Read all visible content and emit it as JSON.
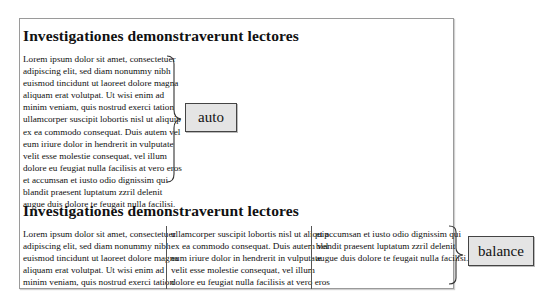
{
  "diagram": {
    "sections": [
      {
        "heading": "Investigationes demonstraverunt lectores",
        "column_fill": "auto",
        "label": "auto",
        "lines": [
          "Lorem ipsum dolor sit amet, consectetuer",
          "adipiscing elit, sed diam nonummy nibh",
          "euismod tincidunt ut laoreet dolore magna",
          "aliquam erat volutpat. Ut wisi enim ad",
          "minim veniam, quis nostrud exerci tation",
          "ullamcorper suscipit lobortis nisl ut aliquip",
          "ex ea commodo consequat. Duis autem vel",
          "eum iriure dolor in hendrerit in vulputate",
          "velit esse molestie consequat, vel illum",
          "dolore eu feugiat nulla facilisis at vero eros",
          "et accumsan et iusto odio dignissim qui",
          "blandit praesent luptatum zzril delenit",
          "augue duis dolore te feugait nulla facilisi."
        ]
      },
      {
        "heading": "Investigationes demonstraverunt lectores",
        "column_fill": "balance",
        "label": "balance",
        "columns": [
          [
            "Lorem ipsum dolor sit amet, consectetuer",
            "adipiscing elit, sed diam nonummy nibh",
            "euismod tincidunt ut laoreet dolore magna",
            "aliquam erat volutpat. Ut wisi enim ad",
            "minim veniam, quis nostrud exerci tation"
          ],
          [
            "ullamcorper suscipit lobortis nisl ut aliquip",
            "ex ea commodo consequat. Duis autem vel",
            "eum iriure dolor in hendrerit in vulputate",
            "velit esse molestie consequat, vel illum",
            "dolore eu feugiat nulla facilisis at vero eros"
          ],
          [
            "et accumsan et iusto odio dignissim qui",
            "blandit praesent luptatum zzril delenit",
            "augue duis dolore te feugait nulla facilisi."
          ]
        ]
      }
    ],
    "colors": {
      "frame_border": "#9a9a9a",
      "label_fill": "#e4e4e4",
      "label_border": "#444444",
      "column_rule": "#555555"
    }
  }
}
